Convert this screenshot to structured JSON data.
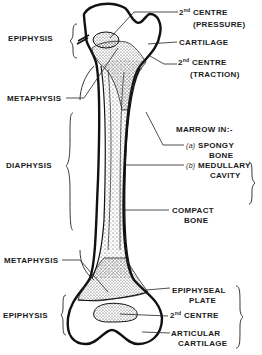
{
  "diagram": {
    "left_labels": {
      "epiphysis_top": "EPIPHYSIS",
      "metaphysis_top": "METAPHYSIS",
      "diaphysis": "DIAPHYSIS",
      "metaphysis_bottom": "METAPHYSIS",
      "epiphysis_bottom": "EPIPHYSIS"
    },
    "right_labels": {
      "centre_pressure": {
        "number": "2",
        "sup": "nd",
        "line1": "CENTRE",
        "line2": "(PRESSURE)"
      },
      "cartilage": "CARTILAGE",
      "centre_traction": {
        "number": "2",
        "sup": "nd",
        "line1": "CENTRE",
        "line2": "(TRACTION)"
      },
      "marrow_heading": "MARROW IN:-",
      "spongy": {
        "marker": "(a)",
        "line1": "SPONGY",
        "line2": "BONE"
      },
      "medullary": {
        "marker": "(b)",
        "line1": "MEDULLARY",
        "line2": "CAVITY"
      },
      "compact": {
        "line1": "COMPACT",
        "line2": "BONE"
      },
      "epiphyseal_plate": {
        "line1": "EPIPHYSEAL",
        "line2": "PLATE"
      },
      "centre_bottom": {
        "number": "2",
        "sup": "nd",
        "line1": "CENTRE"
      },
      "articular": {
        "line1": "ARTICULAR",
        "line2": "CARTILAGE"
      }
    },
    "colors": {
      "ink": "#1a1a1a",
      "background": "#ffffff",
      "stipple": "#333333"
    }
  }
}
